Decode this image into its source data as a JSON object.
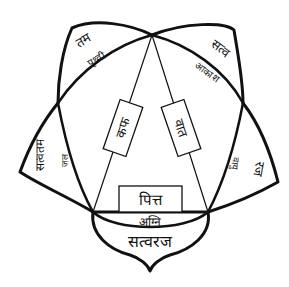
{
  "diagram": {
    "center_boxes": {
      "left": "कफ",
      "right": "वात",
      "bottom": "पित्त"
    },
    "petals": {
      "top_left": {
        "outer": "तम",
        "inner": "पृथ्वी"
      },
      "top_right": {
        "outer": "सत्व",
        "inner": "आकाश"
      },
      "left": {
        "outer": "सत्वतम",
        "inner": "जल"
      },
      "right": {
        "outer": "रज",
        "inner": "वायु"
      },
      "bottom": {
        "outer": "सत्वरज",
        "inner": "अग्नि"
      }
    },
    "colors": {
      "line": "#111111",
      "background": "#ffffff"
    }
  }
}
